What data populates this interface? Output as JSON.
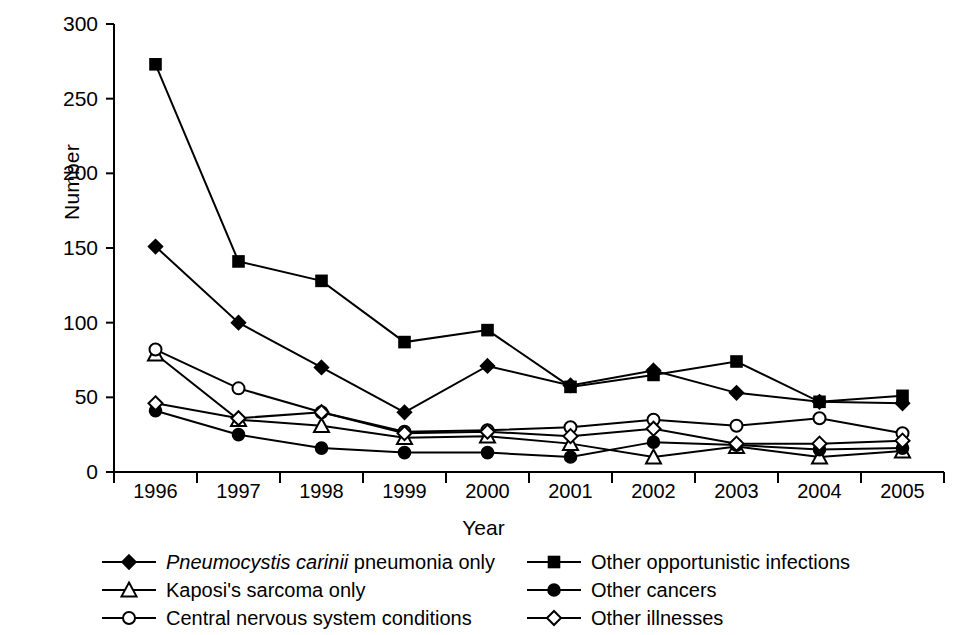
{
  "chart_data": {
    "type": "line",
    "title": "",
    "xlabel": "Year",
    "ylabel": "Number",
    "categories": [
      "1996",
      "1997",
      "1998",
      "1999",
      "2000",
      "2001",
      "2002",
      "2003",
      "2004",
      "2005"
    ],
    "x": [
      1996,
      1997,
      1998,
      1999,
      2000,
      2001,
      2002,
      2003,
      2004,
      2005
    ],
    "ylim": [
      0,
      300
    ],
    "yticks": [
      0,
      50,
      100,
      150,
      200,
      250,
      300
    ],
    "ytick_labels": [
      "0",
      "50",
      "100",
      "150",
      "200",
      "250",
      "300"
    ],
    "grid": false,
    "legend_position": "bottom",
    "series": [
      {
        "name": "Pneumocystis carinii pneumonia only",
        "marker": "filled-diamond",
        "values": [
          151,
          100,
          70,
          40,
          71,
          58,
          68,
          53,
          47,
          46
        ]
      },
      {
        "name": "Other opportunistic infections",
        "marker": "filled-square",
        "values": [
          273,
          141,
          128,
          87,
          95,
          57,
          65,
          74,
          47,
          51
        ]
      },
      {
        "name": "Kaposi's sarcoma only",
        "marker": "open-triangle",
        "values": [
          79,
          35,
          31,
          23,
          24,
          19,
          10,
          17,
          10,
          14
        ]
      },
      {
        "name": "Other cancers",
        "marker": "filled-circle",
        "values": [
          41,
          25,
          16,
          13,
          13,
          10,
          20,
          18,
          15,
          16
        ]
      },
      {
        "name": "Central nervous system conditions",
        "marker": "open-circle",
        "values": [
          82,
          56,
          40,
          27,
          28,
          30,
          35,
          31,
          36,
          26
        ]
      },
      {
        "name": "Other illnesses",
        "marker": "open-diamond",
        "values": [
          46,
          36,
          40,
          26,
          27,
          24,
          29,
          19,
          19,
          21
        ]
      }
    ]
  },
  "axes": {
    "y_title": "Number",
    "x_title": "Year"
  },
  "legend": {
    "left_column": [
      {
        "marker": "filled-diamond",
        "label_italic": "Pneumocystis carinii",
        "label_rest": " pneumonia only"
      },
      {
        "marker": "open-triangle",
        "label_italic": "",
        "label_rest": "Kaposi's sarcoma only"
      },
      {
        "marker": "open-circle",
        "label_italic": "",
        "label_rest": "Central nervous system conditions"
      }
    ],
    "right_column": [
      {
        "marker": "filled-square",
        "label_italic": "",
        "label_rest": "Other opportunistic infections"
      },
      {
        "marker": "filled-circle",
        "label_italic": "",
        "label_rest": "Other cancers"
      },
      {
        "marker": "open-diamond",
        "label_italic": "",
        "label_rest": "Other illnesses"
      }
    ]
  },
  "colors": {
    "ink": "#000000",
    "background": "#ffffff"
  }
}
